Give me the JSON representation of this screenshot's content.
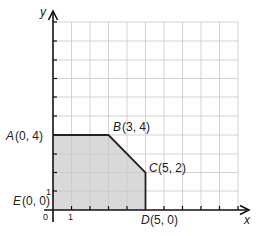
{
  "diagram": {
    "type": "feasible-region-graph",
    "axes": {
      "x_label": "x",
      "y_label": "y",
      "origin_label": "0",
      "x_tick_label": "1",
      "y_tick_label": "1",
      "x_range": [
        0,
        10
      ],
      "y_range": [
        0,
        10
      ]
    },
    "points": [
      {
        "name": "A",
        "coords": "(0, 4)",
        "x": 0,
        "y": 4
      },
      {
        "name": "B",
        "coords": "(3, 4)",
        "x": 3,
        "y": 4
      },
      {
        "name": "C",
        "coords": "(5, 2)",
        "x": 5,
        "y": 2
      },
      {
        "name": "D",
        "coords": "(5, 0)",
        "x": 5,
        "y": 0
      },
      {
        "name": "E",
        "coords": "(0, 0)",
        "x": 0,
        "y": 0
      }
    ],
    "colors": {
      "region_fill": "#d9d9d9",
      "grid": "#c8c8c8",
      "axis": "#111111",
      "boundary": "#222222"
    }
  }
}
